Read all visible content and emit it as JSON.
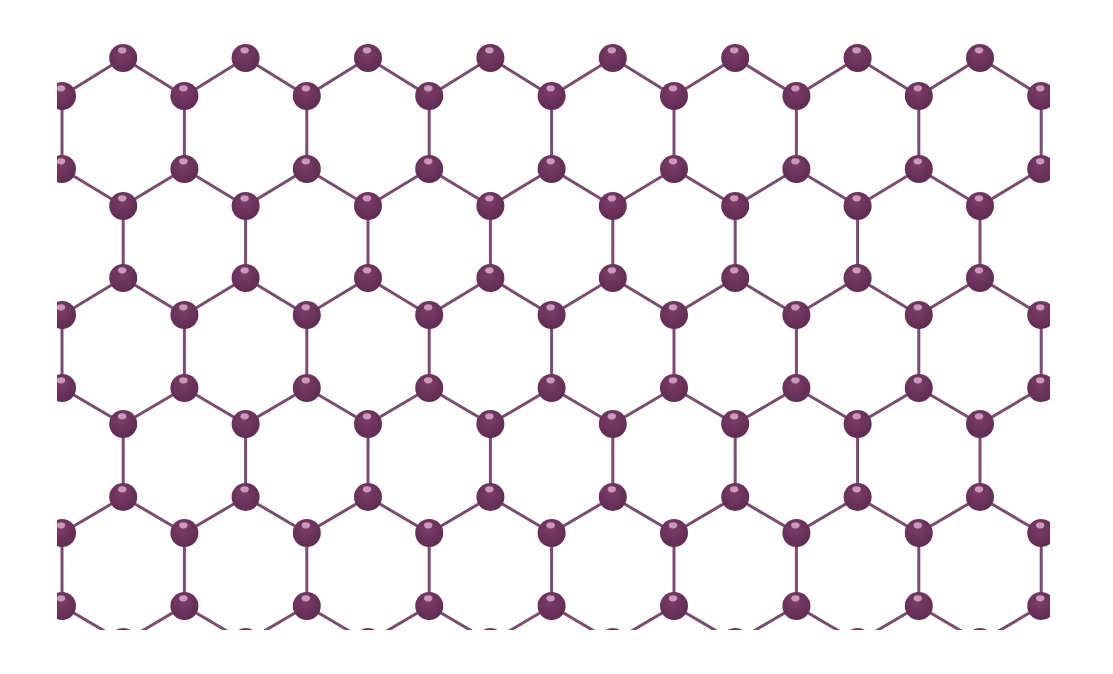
{
  "diagram": {
    "orientation": "zigzag-horizontal (vertical bonds)",
    "canvas": {
      "width": 1113,
      "height": 674,
      "background": "#ffffff"
    },
    "clip": {
      "x": 57,
      "y": 20,
      "width": 993,
      "height": 610
    },
    "colors": {
      "atom": "#7b3d69",
      "atom_dark": "#5e2a50",
      "atom_highlight": "#d9a9c8",
      "bond": "#7d4a70"
    },
    "atom_radius": 14,
    "bond_width": 3,
    "lattice": {
      "x0": 62,
      "dx": 61.2,
      "columns": 17,
      "rows": [
        {
          "y": 58,
          "parity": "odd"
        },
        {
          "y": 96,
          "parity": "even"
        },
        {
          "y": 169,
          "parity": "even"
        },
        {
          "y": 206,
          "parity": "odd"
        },
        {
          "y": 278,
          "parity": "odd"
        },
        {
          "y": 315,
          "parity": "even"
        },
        {
          "y": 388,
          "parity": "even"
        },
        {
          "y": 424,
          "parity": "odd"
        },
        {
          "y": 497,
          "parity": "odd"
        },
        {
          "y": 533,
          "parity": "even"
        },
        {
          "y": 606,
          "parity": "even"
        },
        {
          "y": 642,
          "parity": "odd"
        }
      ],
      "vertical_bonds": [
        [
          1,
          2
        ],
        [
          3,
          4
        ],
        [
          5,
          6
        ],
        [
          7,
          8
        ],
        [
          9,
          10
        ]
      ],
      "diagonal_bonds": [
        [
          0,
          1
        ],
        [
          2,
          3
        ],
        [
          4,
          5
        ],
        [
          6,
          7
        ],
        [
          8,
          9
        ],
        [
          10,
          11
        ]
      ]
    }
  }
}
